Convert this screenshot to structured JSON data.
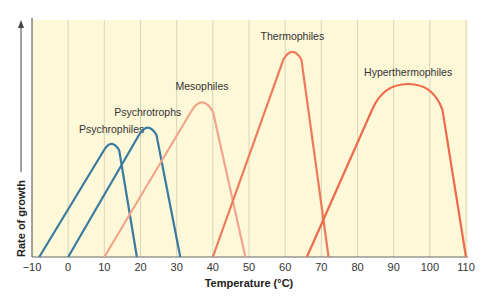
{
  "chart_data": {
    "type": "line",
    "title": "",
    "xlabel": "Temperature (°C)",
    "ylabel": "Rate of growth",
    "xlim": [
      -10,
      110
    ],
    "xticks": [
      -10,
      0,
      10,
      20,
      30,
      40,
      50,
      60,
      70,
      80,
      90,
      100,
      110
    ],
    "grid": {
      "vertical": true,
      "horizontal": false
    },
    "background": "#fdf8d8",
    "series": [
      {
        "name": "Psychrophiles",
        "color": "#3a7aa0",
        "min": -8,
        "optimum": 12,
        "max": 19,
        "peak_rate": 0.49
      },
      {
        "name": "Psychrotrophs",
        "color": "#3a7aa0",
        "min": 0,
        "optimum": 22,
        "max": 31,
        "peak_rate": 0.56
      },
      {
        "name": "Mesophiles",
        "color": "#f2a58a",
        "min": 10,
        "optimum": 37,
        "max": 49,
        "peak_rate": 0.67
      },
      {
        "name": "Thermophiles",
        "color": "#ef7a5a",
        "min": 40,
        "optimum": 62,
        "max": 72,
        "peak_rate": 0.88
      },
      {
        "name": "Hyperthermophiles",
        "color": "#ee6a4a",
        "min": 66,
        "optimum": 94,
        "max": 110,
        "peak_rate": 0.73
      }
    ]
  }
}
